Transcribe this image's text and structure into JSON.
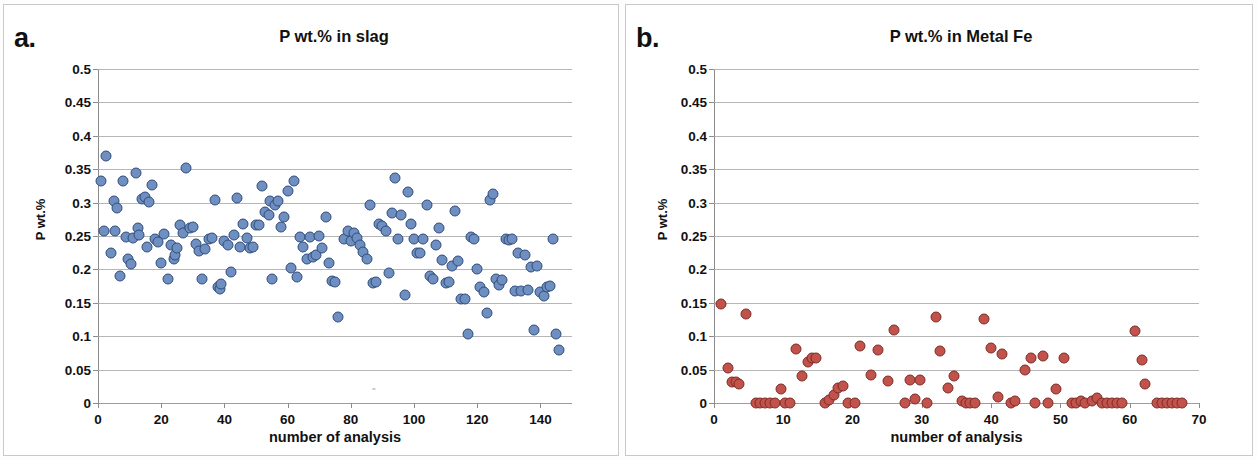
{
  "figure": {
    "panels": [
      {
        "letter": "a.",
        "title": "P wt.% in slag",
        "xlabel": "number of analysis",
        "ylabel": "P wt.%"
      },
      {
        "letter": "b.",
        "title": "P wt.% in Metal Fe",
        "xlabel": "number of analysis",
        "ylabel": "P wt.%"
      }
    ]
  },
  "colors": {
    "slag_marker": "#6f8fc0",
    "slag_marker_edge": "#2e4d7d",
    "metal_marker": "#c2534c",
    "metal_marker_edge": "#7d2b26",
    "gridline": "#a9a9a9",
    "axis": "#8c8c8c",
    "panel_border": "#c9c9c9"
  },
  "chart_data": [
    {
      "type": "scatter",
      "panel": "a",
      "title": "P wt.% in slag",
      "xlabel": "number of analysis",
      "ylabel": "P wt.%",
      "xlim": [
        0,
        150
      ],
      "ylim": [
        0,
        0.5
      ],
      "xticks": [
        0,
        20,
        40,
        60,
        80,
        100,
        120,
        140
      ],
      "yticks": [
        0,
        0.05,
        0.1,
        0.15,
        0.2,
        0.25,
        0.3,
        0.35,
        0.4,
        0.45,
        0.5
      ],
      "ytick_labels": [
        "0",
        "0.05",
        "0.1",
        "0.15",
        "0.2",
        "0.25",
        "0.3",
        "0.35",
        "0.4",
        "0.45",
        "0.5"
      ],
      "grid": true,
      "legend": false,
      "marker_color": "#6f8fc0",
      "points": [
        [
          1,
          0.333
        ],
        [
          2,
          0.258
        ],
        [
          2.5,
          0.37
        ],
        [
          4,
          0.224
        ],
        [
          5,
          0.302
        ],
        [
          5.5,
          0.258
        ],
        [
          6,
          0.292
        ],
        [
          7,
          0.19
        ],
        [
          8,
          0.333
        ],
        [
          9,
          0.248
        ],
        [
          9.5,
          0.215
        ],
        [
          10.5,
          0.208
        ],
        [
          11,
          0.247
        ],
        [
          12,
          0.345
        ],
        [
          12.5,
          0.262
        ],
        [
          13,
          0.252
        ],
        [
          14,
          0.305
        ],
        [
          15,
          0.308
        ],
        [
          15.5,
          0.233
        ],
        [
          16,
          0.301
        ],
        [
          17,
          0.327
        ],
        [
          18,
          0.246
        ],
        [
          19,
          0.241
        ],
        [
          20,
          0.209
        ],
        [
          21,
          0.253
        ],
        [
          22,
          0.185
        ],
        [
          23,
          0.237
        ],
        [
          24,
          0.216
        ],
        [
          24.5,
          0.222
        ],
        [
          25,
          0.232
        ],
        [
          26,
          0.267
        ],
        [
          27,
          0.255
        ],
        [
          28,
          0.352
        ],
        [
          29,
          0.262
        ],
        [
          30,
          0.264
        ],
        [
          31,
          0.238
        ],
        [
          32,
          0.228
        ],
        [
          33,
          0.185
        ],
        [
          34,
          0.231
        ],
        [
          35,
          0.246
        ],
        [
          36,
          0.247
        ],
        [
          37,
          0.304
        ],
        [
          38,
          0.174
        ],
        [
          38.5,
          0.17
        ],
        [
          39,
          0.178
        ],
        [
          40,
          0.243
        ],
        [
          41,
          0.236
        ],
        [
          42,
          0.196
        ],
        [
          43,
          0.252
        ],
        [
          44,
          0.307
        ],
        [
          45,
          0.233
        ],
        [
          46,
          0.268
        ],
        [
          47,
          0.247
        ],
        [
          48,
          0.232
        ],
        [
          49,
          0.233
        ],
        [
          50,
          0.267
        ],
        [
          51,
          0.266
        ],
        [
          52,
          0.325
        ],
        [
          53,
          0.286
        ],
        [
          54,
          0.282
        ],
        [
          54.5,
          0.302
        ],
        [
          55,
          0.185
        ],
        [
          56,
          0.297
        ],
        [
          57,
          0.302
        ],
        [
          58,
          0.264
        ],
        [
          59,
          0.279
        ],
        [
          60,
          0.317
        ],
        [
          61,
          0.202
        ],
        [
          62,
          0.332
        ],
        [
          63,
          0.188
        ],
        [
          64,
          0.248
        ],
        [
          65,
          0.234
        ],
        [
          66,
          0.215
        ],
        [
          67,
          0.248
        ],
        [
          68,
          0.218
        ],
        [
          69,
          0.222
        ],
        [
          70,
          0.25
        ],
        [
          71,
          0.232
        ],
        [
          72,
          0.278
        ],
        [
          73,
          0.21
        ],
        [
          74,
          0.183
        ],
        [
          75,
          0.181
        ],
        [
          76,
          0.128
        ],
        [
          78,
          0.245
        ],
        [
          79,
          0.257
        ],
        [
          80,
          0.243
        ],
        [
          81,
          0.254
        ],
        [
          82,
          0.247
        ],
        [
          83,
          0.237
        ],
        [
          84,
          0.226
        ],
        [
          85,
          0.216
        ],
        [
          86,
          0.297
        ],
        [
          87,
          0.179
        ],
        [
          88,
          0.181
        ],
        [
          89,
          0.268
        ],
        [
          90,
          0.265
        ],
        [
          91,
          0.257
        ],
        [
          92,
          0.194
        ],
        [
          93,
          0.284
        ],
        [
          94,
          0.337
        ],
        [
          95,
          0.246
        ],
        [
          96,
          0.282
        ],
        [
          97,
          0.162
        ],
        [
          98,
          0.316
        ],
        [
          99,
          0.268
        ],
        [
          100,
          0.246
        ],
        [
          101,
          0.225
        ],
        [
          102,
          0.224
        ],
        [
          103,
          0.246
        ],
        [
          104,
          0.297
        ],
        [
          105,
          0.19
        ],
        [
          106,
          0.185
        ],
        [
          107,
          0.237
        ],
        [
          108,
          0.262
        ],
        [
          109,
          0.214
        ],
        [
          110,
          0.18
        ],
        [
          111,
          0.181
        ],
        [
          112,
          0.205
        ],
        [
          113,
          0.288
        ],
        [
          114,
          0.213
        ],
        [
          115,
          0.156
        ],
        [
          116,
          0.155
        ],
        [
          117,
          0.103
        ],
        [
          118,
          0.248
        ],
        [
          119,
          0.246
        ],
        [
          120,
          0.201
        ],
        [
          121,
          0.174
        ],
        [
          122,
          0.166
        ],
        [
          123,
          0.135
        ],
        [
          124,
          0.304
        ],
        [
          125,
          0.313
        ],
        [
          126,
          0.186
        ],
        [
          127,
          0.177
        ],
        [
          128,
          0.184
        ],
        [
          129,
          0.246
        ],
        [
          130,
          0.244
        ],
        [
          131,
          0.245
        ],
        [
          132,
          0.168
        ],
        [
          133,
          0.225
        ],
        [
          134,
          0.167
        ],
        [
          135,
          0.222
        ],
        [
          136,
          0.169
        ],
        [
          137,
          0.203
        ],
        [
          138,
          0.11
        ],
        [
          139,
          0.205
        ],
        [
          140,
          0.166
        ],
        [
          141,
          0.16
        ],
        [
          142,
          0.173
        ],
        [
          143,
          0.175
        ],
        [
          144,
          0.246
        ],
        [
          145,
          0.103
        ],
        [
          146,
          0.079
        ]
      ]
    },
    {
      "type": "scatter",
      "panel": "b",
      "title": "P wt.% in Metal Fe",
      "xlabel": "number of analysis",
      "ylabel": "P wt.%",
      "xlim": [
        0,
        70
      ],
      "ylim": [
        0,
        0.5
      ],
      "xticks": [
        0,
        10,
        20,
        30,
        40,
        50,
        60,
        70
      ],
      "yticks": [
        0,
        0.05,
        0.1,
        0.15,
        0.2,
        0.25,
        0.3,
        0.35,
        0.4,
        0.45,
        0.5
      ],
      "ytick_labels": [
        "0",
        "0.05",
        "0.1",
        "0.15",
        "0.2",
        "0.25",
        "0.3",
        "0.35",
        "0.4",
        "0.45",
        "0.5"
      ],
      "grid": true,
      "legend": false,
      "marker_color": "#c2534c",
      "points": [
        [
          1,
          0.148
        ],
        [
          2,
          0.052
        ],
        [
          2.6,
          0.032
        ],
        [
          3.2,
          0.031
        ],
        [
          3.6,
          0.029
        ],
        [
          4.6,
          0.133
        ],
        [
          6,
          0.0
        ],
        [
          6.7,
          0.0
        ],
        [
          7.4,
          0.0
        ],
        [
          8.1,
          0.0
        ],
        [
          8.8,
          0.0
        ],
        [
          9.6,
          0.021
        ],
        [
          10.2,
          0.0
        ],
        [
          10.9,
          0.0
        ],
        [
          11.8,
          0.081
        ],
        [
          12.7,
          0.041
        ],
        [
          13.6,
          0.062
        ],
        [
          14.1,
          0.067
        ],
        [
          14.7,
          0.067
        ],
        [
          16,
          0.0
        ],
        [
          16.6,
          0.005
        ],
        [
          17.3,
          0.012
        ],
        [
          17.9,
          0.022
        ],
        [
          18.6,
          0.025
        ],
        [
          19.3,
          0.0
        ],
        [
          20.4,
          0.0
        ],
        [
          21,
          0.086
        ],
        [
          22.6,
          0.042
        ],
        [
          23.7,
          0.079
        ],
        [
          25.1,
          0.033
        ],
        [
          26,
          0.109
        ],
        [
          27.5,
          0.0
        ],
        [
          28.3,
          0.034
        ],
        [
          29,
          0.006
        ],
        [
          29.8,
          0.034
        ],
        [
          30.8,
          0.0
        ],
        [
          32,
          0.128
        ],
        [
          32.6,
          0.078
        ],
        [
          33.8,
          0.022
        ],
        [
          34.6,
          0.041
        ],
        [
          35.8,
          0.003
        ],
        [
          36.4,
          0.0
        ],
        [
          37,
          0.0
        ],
        [
          37.6,
          0.0
        ],
        [
          39,
          0.126
        ],
        [
          40,
          0.082
        ],
        [
          41,
          0.009
        ],
        [
          41.6,
          0.074
        ],
        [
          42.8,
          0.0
        ],
        [
          43.5,
          0.003
        ],
        [
          44.9,
          0.05
        ],
        [
          45.8,
          0.068
        ],
        [
          46.3,
          0.0
        ],
        [
          47.5,
          0.071
        ],
        [
          48.2,
          0.0
        ],
        [
          49.4,
          0.021
        ],
        [
          50.5,
          0.068
        ],
        [
          51.6,
          0.0
        ],
        [
          52.3,
          0.0
        ],
        [
          52.9,
          0.003
        ],
        [
          53.5,
          0.0
        ],
        [
          54.5,
          0.003
        ],
        [
          55.3,
          0.007
        ],
        [
          56,
          0.0
        ],
        [
          56.7,
          0.0
        ],
        [
          57.4,
          0.0
        ],
        [
          58.1,
          0.0
        ],
        [
          58.9,
          0.0
        ],
        [
          60.8,
          0.108
        ],
        [
          61.8,
          0.064
        ],
        [
          62.2,
          0.028
        ],
        [
          64,
          0.0
        ],
        [
          64.7,
          0.0
        ],
        [
          65.4,
          0.0
        ],
        [
          66.1,
          0.0
        ],
        [
          66.8,
          0.0
        ],
        [
          67.5,
          0.0
        ]
      ]
    }
  ]
}
